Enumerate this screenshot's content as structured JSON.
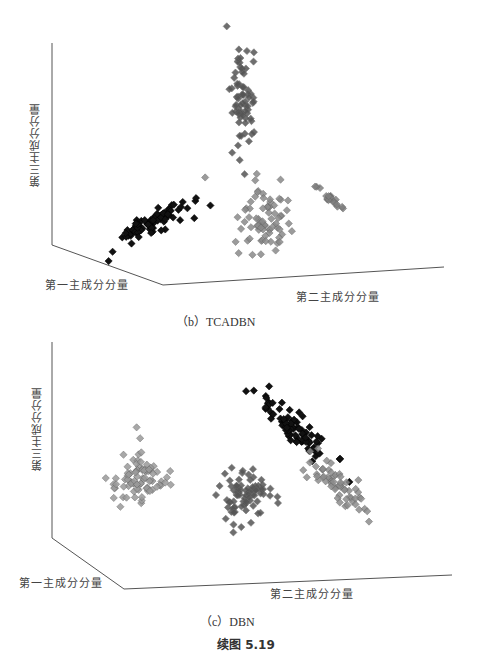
{
  "chart_data": [
    {
      "type": "scatter",
      "subtype": "3d-scatter",
      "title": "(b) TCADBN",
      "xlabel": "第一主成分分量",
      "ylabel": "第二主成分分量",
      "zlabel": "第三主成分分量",
      "marker": "diamond",
      "grid": false,
      "legend": null,
      "clusters": [
        {
          "name": "cluster-black",
          "color": "#111111",
          "approx_count": 90,
          "screen_center": [
            155,
            222
          ],
          "screen_spread": [
            45,
            25
          ],
          "shape": "elongated diagonal"
        },
        {
          "name": "cluster-darkgray-vertical",
          "color": "#555555",
          "approx_count": 70,
          "screen_center": [
            243,
            105
          ],
          "screen_spread": [
            12,
            45
          ],
          "shape": "vertical column"
        },
        {
          "name": "cluster-gray-mixed",
          "color": "#8a8a8a",
          "approx_count": 75,
          "screen_center": [
            265,
            220
          ],
          "screen_spread": [
            28,
            35
          ],
          "shape": "diffuse"
        },
        {
          "name": "cluster-gray-tight",
          "color": "#7f7f7f",
          "approx_count": 20,
          "screen_center": [
            333,
            200
          ],
          "screen_spread": [
            15,
            8
          ],
          "shape": "tight diagonal"
        }
      ]
    },
    {
      "type": "scatter",
      "subtype": "3d-scatter",
      "title": "(c) DBN",
      "xlabel": "第一主成分分量",
      "ylabel": "第二主成分分量",
      "zlabel": "第三主成分分量",
      "marker": "diamond",
      "grid": false,
      "legend": null,
      "clusters": [
        {
          "name": "cluster-lightgray",
          "color": "#9a9a9a",
          "approx_count": 85,
          "screen_center": [
            140,
            478
          ],
          "screen_spread": [
            30,
            25
          ],
          "shape": "diffuse"
        },
        {
          "name": "cluster-black",
          "color": "#111111",
          "approx_count": 80,
          "screen_center": [
            295,
            430
          ],
          "screen_spread": [
            40,
            35
          ],
          "shape": "diagonal band"
        },
        {
          "name": "cluster-darkgray",
          "color": "#555555",
          "approx_count": 80,
          "screen_center": [
            245,
            497
          ],
          "screen_spread": [
            25,
            25
          ],
          "shape": "dense blob"
        },
        {
          "name": "cluster-gray-band",
          "color": "#8c8c8c",
          "approx_count": 60,
          "screen_center": [
            335,
            485
          ],
          "screen_spread": [
            30,
            35
          ],
          "shape": "diagonal band"
        }
      ]
    }
  ],
  "panels": {
    "b": {
      "axis_z_label": "第三主成分分量",
      "axis_x_label": "第一主成分分量",
      "axis_y_label": "第二主成分分量",
      "caption": "（b）TCADBN"
    },
    "c": {
      "axis_z_label": "第三主成分分量",
      "axis_x_label": "第一主成分分量",
      "axis_y_label": "第二主成分分量",
      "caption": "（c）DBN"
    }
  },
  "figure_caption": "续图 5.19"
}
